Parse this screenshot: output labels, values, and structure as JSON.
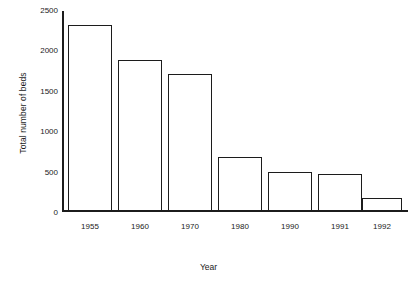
{
  "chart_data": {
    "type": "bar",
    "title": "",
    "xlabel": "Year",
    "ylabel": "Total number of beds",
    "categories": [
      "1955",
      "1960",
      "1970",
      "1980",
      "1990",
      "1991",
      "1992"
    ],
    "values": [
      2320,
      1880,
      1710,
      665,
      480,
      455,
      145
    ],
    "ylim": [
      0,
      2500
    ],
    "yticks": [
      0,
      500,
      1000,
      1500,
      2000,
      2500
    ],
    "ytick_labels": [
      "0",
      "500",
      "1000",
      "1500",
      "2000",
      "2500"
    ],
    "grid": false,
    "legend": null,
    "bar_style": {
      "fill": "#ffffff",
      "edge": "#1c1c1c"
    }
  },
  "axis": {
    "line_color": "#1c1c1c"
  },
  "caption": {
    "text": ""
  }
}
